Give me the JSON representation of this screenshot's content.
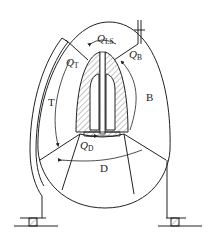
{
  "diagram": {
    "type": "cross-section",
    "regions": {
      "top_left": "T",
      "right": "B",
      "bottom": "D"
    },
    "flows": [
      {
        "symbol": "Q",
        "subscript": "LS"
      },
      {
        "symbol": "Q",
        "subscript": "T"
      },
      {
        "symbol": "Q",
        "subscript": "B"
      },
      {
        "symbol": "Q",
        "subscript": "D"
      }
    ],
    "colors": {
      "line": "#222222",
      "hatch": "#555555",
      "background": "#ffffff"
    }
  }
}
